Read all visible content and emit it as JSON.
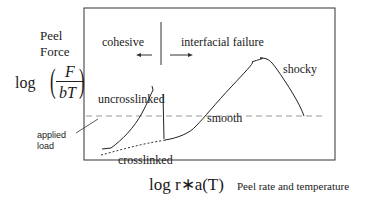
{
  "y_axis": {
    "title_line1": "Peel",
    "title_line2": "Force",
    "formula_prefix": "log",
    "formula_numerator": "F",
    "formula_denominator": "bT"
  },
  "x_axis": {
    "formula": "log r∗a(T)",
    "label": "Peel rate and temperature"
  },
  "regions": {
    "left": "cohesive",
    "right": "interfacial failure"
  },
  "curves": {
    "uncrosslinked": "uncrosslinked",
    "crosslinked": "crosslinked",
    "smooth": "smooth",
    "shocky": "shocky"
  },
  "annotation": {
    "line1": "applied",
    "line2": "load"
  },
  "colors": {
    "ink": "#1a1a1a",
    "dashed": "#999999"
  }
}
